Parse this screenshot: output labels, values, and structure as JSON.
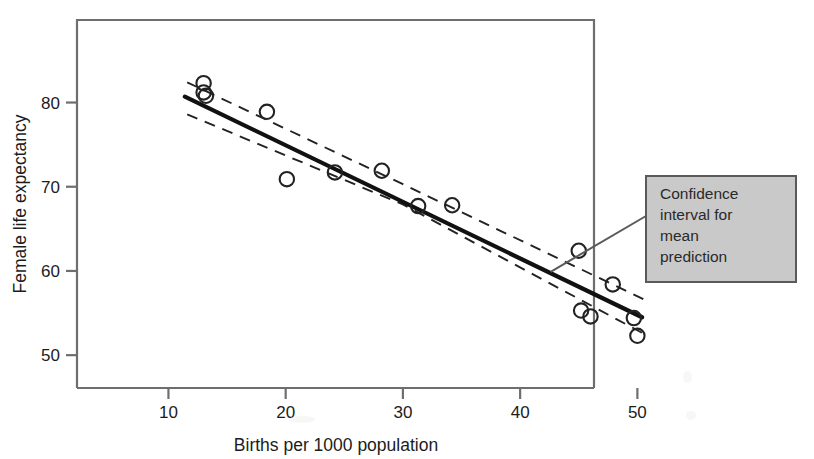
{
  "figure": {
    "background_color": "#ffffff",
    "frame_color": "#6e6e6e",
    "data_color": "#222222"
  },
  "annotation": {
    "name": "confidence-interval-callout",
    "lines": [
      "Confidence",
      "interval for",
      "mean",
      "prediction"
    ],
    "full_text": "Confidence interval for mean prediction",
    "box_fill": "#c9c9c9",
    "box_border": "#5a5a5a",
    "leader_color": "#5a5a5a"
  },
  "chart_data": {
    "type": "scatter",
    "title": "",
    "xlabel": "Births per 1000 population",
    "ylabel": "Female life expectancy",
    "xlim": [
      2.2,
      46.3
    ],
    "ylim": [
      46.1,
      89.8
    ],
    "xticks": [
      10,
      20,
      30,
      40,
      50
    ],
    "yticks": [
      50,
      60,
      70,
      80
    ],
    "xtick_labels": [
      "10",
      "20",
      "30",
      "40",
      "50"
    ],
    "ytick_labels": [
      "50",
      "60",
      "70",
      "80"
    ],
    "grid": false,
    "legend": null,
    "marker": "open-circle",
    "points": [
      {
        "x": 13.0,
        "y": 82.3
      },
      {
        "x": 13.0,
        "y": 81.2
      },
      {
        "x": 13.2,
        "y": 80.8
      },
      {
        "x": 18.4,
        "y": 78.9
      },
      {
        "x": 20.1,
        "y": 70.9
      },
      {
        "x": 24.2,
        "y": 71.7
      },
      {
        "x": 28.2,
        "y": 71.9
      },
      {
        "x": 31.3,
        "y": 67.7
      },
      {
        "x": 34.2,
        "y": 67.8
      },
      {
        "x": 45.0,
        "y": 62.4
      },
      {
        "x": 45.2,
        "y": 55.3
      },
      {
        "x": 46.0,
        "y": 54.6
      },
      {
        "x": 47.9,
        "y": 58.4
      },
      {
        "x": 49.7,
        "y": 54.4
      },
      {
        "x": 50.0,
        "y": 52.3
      }
    ],
    "fit_line": {
      "name": "regression-line",
      "style": "solid",
      "x_start": 11.4,
      "y_start": 80.7,
      "x_end": 50.4,
      "y_end": 54.5
    },
    "confidence_band": {
      "name": "confidence-interval-mean-prediction",
      "style": "dashed",
      "upper": [
        {
          "x": 11.6,
          "y": 82.4
        },
        {
          "x": 30.0,
          "y": 70.3
        },
        {
          "x": 50.6,
          "y": 56.6
        }
      ],
      "lower": [
        {
          "x": 11.6,
          "y": 78.6
        },
        {
          "x": 30.0,
          "y": 67.9
        },
        {
          "x": 50.6,
          "y": 52.5
        }
      ]
    }
  }
}
